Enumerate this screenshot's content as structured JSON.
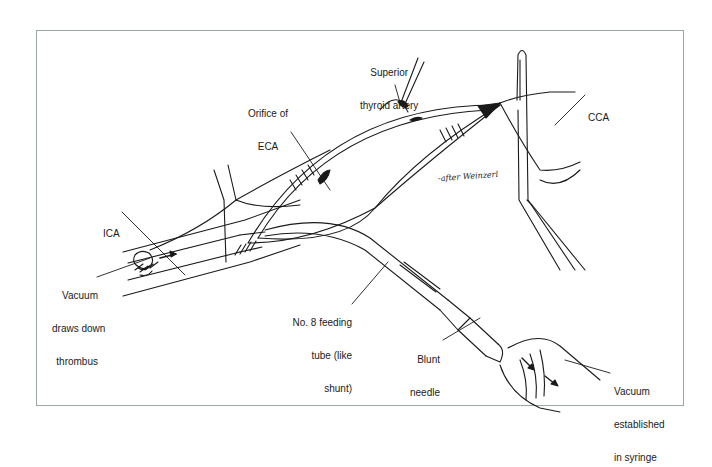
{
  "figure": {
    "type": "surgical illustration",
    "signature": "-after Weinzerl",
    "border_color": "#9aa7a7",
    "line_color": "#1a1a1a"
  },
  "labels": {
    "superior_thyroid_artery": {
      "line1": "Superior",
      "line2": "thyroid artery"
    },
    "orifice_eca": {
      "line1": "Orifice of",
      "line2": "ECA"
    },
    "cca": {
      "line1": "CCA"
    },
    "ica": {
      "line1": "ICA"
    },
    "vacuum_thrombus": {
      "line1": "Vacuum",
      "line2": "draws down",
      "line3": "thrombus"
    },
    "feeding_tube": {
      "line1": "No. 8 feeding",
      "line2": "tube (like",
      "line3": "shunt)"
    },
    "blunt_needle": {
      "line1": "Blunt",
      "line2": "needle"
    },
    "vacuum_syringe": {
      "line1": "Vacuum",
      "line2": "established",
      "line3": "in syringe"
    }
  }
}
